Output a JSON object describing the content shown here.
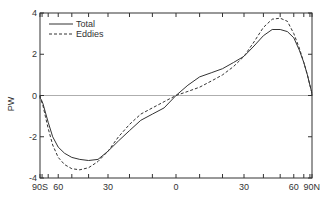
{
  "chart_data": {
    "type": "line",
    "title": "",
    "xlabel": "",
    "ylabel": "PW",
    "x_scale": "sine-latitude",
    "xlim": [
      -90,
      90
    ],
    "ylim": [
      -4,
      4
    ],
    "grid": false,
    "zero_line": true,
    "x_ticks": [
      -90,
      -80,
      -70,
      -60,
      -50,
      -40,
      -30,
      -20,
      -10,
      0,
      10,
      20,
      30,
      40,
      50,
      60,
      70,
      80,
      90
    ],
    "x_tick_labels": [
      {
        "lat": -90,
        "label": "90S"
      },
      {
        "lat": -60,
        "label": "60"
      },
      {
        "lat": -30,
        "label": "30"
      },
      {
        "lat": 0,
        "label": "0"
      },
      {
        "lat": 30,
        "label": "30"
      },
      {
        "lat": 60,
        "label": "60"
      },
      {
        "lat": 90,
        "label": "90N"
      }
    ],
    "y_ticks": [
      -4,
      -2,
      0,
      2,
      4
    ],
    "y_tick_labels": [
      "-4",
      "-2",
      "0",
      "2",
      "4"
    ],
    "legend": {
      "position": "upper-left",
      "entries": [
        "Total",
        "Eddies"
      ]
    },
    "series": [
      {
        "name": "Total",
        "style": "solid",
        "x": [
          -90,
          -86,
          -82,
          -78,
          -74,
          -70,
          -65,
          -60,
          -55,
          -50,
          -45,
          -40,
          -35,
          -30,
          -25,
          -20,
          -15,
          -10,
          -5,
          0,
          5,
          10,
          15,
          20,
          25,
          30,
          35,
          40,
          45,
          50,
          55,
          60,
          65,
          70,
          75,
          80,
          85,
          90
        ],
        "values": [
          0,
          -0.15,
          -0.2,
          -0.4,
          -0.8,
          -1.3,
          -2.0,
          -2.5,
          -2.8,
          -3.0,
          -3.1,
          -3.15,
          -3.1,
          -2.7,
          -2.2,
          -1.7,
          -1.2,
          -0.9,
          -0.6,
          0.0,
          0.5,
          0.9,
          1.1,
          1.3,
          1.6,
          1.9,
          2.4,
          2.9,
          3.2,
          3.2,
          3.1,
          2.8,
          2.2,
          1.6,
          1.0,
          0.5,
          0.2,
          0
        ]
      },
      {
        "name": "Eddies",
        "style": "dashed",
        "x": [
          -90,
          -86,
          -82,
          -78,
          -74,
          -70,
          -65,
          -60,
          -55,
          -50,
          -45,
          -40,
          -35,
          -30,
          -25,
          -20,
          -15,
          -10,
          -5,
          0,
          5,
          10,
          15,
          20,
          25,
          30,
          35,
          40,
          45,
          50,
          55,
          60,
          65,
          70,
          75,
          80,
          85,
          90
        ],
        "values": [
          0,
          -0.15,
          -0.25,
          -0.5,
          -1.0,
          -1.6,
          -2.4,
          -3.0,
          -3.35,
          -3.55,
          -3.6,
          -3.5,
          -3.2,
          -2.7,
          -2.0,
          -1.4,
          -0.9,
          -0.6,
          -0.3,
          0.0,
          0.2,
          0.4,
          0.7,
          1.0,
          1.4,
          1.9,
          2.6,
          3.3,
          3.7,
          3.75,
          3.6,
          3.0,
          2.3,
          1.6,
          1.0,
          0.5,
          0.2,
          0
        ]
      }
    ]
  },
  "colors": {
    "axis": "#333333",
    "line": "#333333",
    "background": "#ffffff"
  }
}
